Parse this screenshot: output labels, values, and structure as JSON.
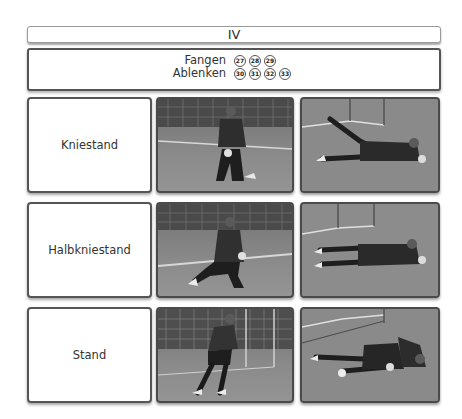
{
  "header": {
    "title": "IV"
  },
  "legend": {
    "items": [
      {
        "label": "Fangen",
        "numbers": [
          "27",
          "28",
          "29"
        ]
      },
      {
        "label": "Ablenken",
        "numbers": [
          "30",
          "31",
          "32",
          "33"
        ]
      }
    ]
  },
  "rows": [
    {
      "label": "Kniestand",
      "photos": [
        {
          "alt": "goalkeeper-kneeling-catch-photo"
        },
        {
          "alt": "goalkeeper-diving-save-photo"
        }
      ]
    },
    {
      "label": "Halbkniestand",
      "photos": [
        {
          "alt": "goalkeeper-half-kneeling-photo"
        },
        {
          "alt": "goalkeeper-lying-save-photo"
        }
      ]
    },
    {
      "label": "Stand",
      "photos": [
        {
          "alt": "goalkeeper-standing-ready-photo"
        },
        {
          "alt": "goalkeeper-ground-save-photo"
        }
      ]
    }
  ],
  "colors": {
    "border_dark": "#555555",
    "border_light": "#9a9a9a",
    "background": "#ffffff",
    "text": "#333333"
  }
}
